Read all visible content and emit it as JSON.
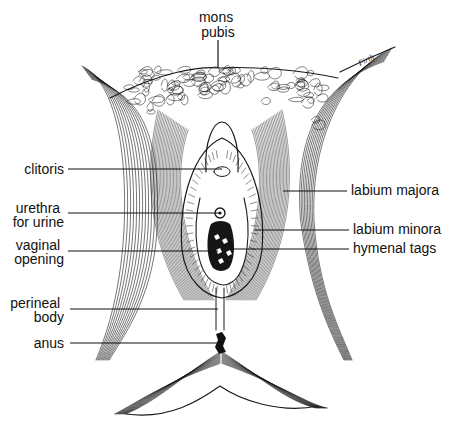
{
  "diagram": {
    "signature": "Firth",
    "labels": {
      "mons_pubis": [
        "mons",
        "pubis"
      ],
      "clitoris": [
        "clitoris"
      ],
      "urethra": [
        "urethra",
        "for urine"
      ],
      "vaginal_opening": [
        "vaginal",
        "opening"
      ],
      "perineal_body": [
        "perineal",
        "body"
      ],
      "anus": [
        "anus"
      ],
      "labium_majora": [
        "labium majora"
      ],
      "labium_minora": [
        "labium minora"
      ],
      "hymenal_tags": [
        "hymenal tags"
      ]
    },
    "colors": {
      "ink": "#1a1a1a",
      "background": "#ffffff"
    }
  }
}
